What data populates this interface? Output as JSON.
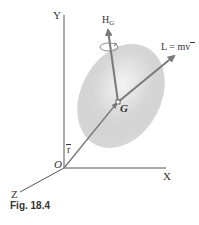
{
  "figure": {
    "caption": "Fig. 18.4",
    "axes": {
      "x_label": "X",
      "y_label": "Y",
      "z_label": "Z",
      "origin_label": "O"
    },
    "body": {
      "center_label": "G"
    },
    "vectors": {
      "angular_momentum_label": "H",
      "angular_momentum_subscript": "G",
      "linear_momentum_label": "L = mv",
      "position_label": "r"
    },
    "colors": {
      "axis": "#555555",
      "vector": "#7a7a7a",
      "body_fill": "#cfcfcf",
      "text": "#333333",
      "caption": "#333333"
    }
  }
}
